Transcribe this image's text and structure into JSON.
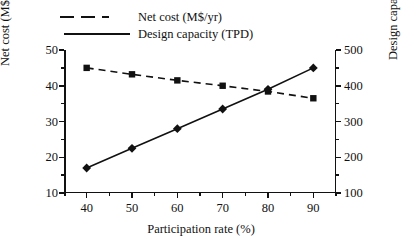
{
  "chart_data": {
    "type": "line",
    "title": "",
    "xlabel": "Participation rate (%)",
    "ylabel": "Net cost (M$/yr)",
    "ylabel_secondary": "Design capacity (TPD)",
    "x": [
      40,
      50,
      60,
      70,
      80,
      90
    ],
    "xlim": [
      35,
      95
    ],
    "xticks": [
      40,
      50,
      60,
      70,
      80,
      90
    ],
    "xtick_labels": [
      "40",
      "50",
      "60",
      "70",
      "80",
      "90"
    ],
    "ylim": [
      10,
      50
    ],
    "yticks": [
      10,
      20,
      30,
      40,
      50
    ],
    "ytick_labels": [
      "10",
      "20",
      "30",
      "40",
      "50"
    ],
    "ylim_secondary": [
      100,
      500
    ],
    "yticks_secondary": [
      100,
      200,
      300,
      400,
      500
    ],
    "ytick_labels_secondary": [
      "100",
      "200",
      "300",
      "400",
      "500"
    ],
    "grid": false,
    "legend_position": "top",
    "series": [
      {
        "name": "Net cost (M$/yr)",
        "axis": "left",
        "style": "dashed",
        "marker": "square",
        "color": "#111111",
        "values": [
          45.0,
          43.2,
          41.5,
          40.0,
          38.4,
          36.5
        ]
      },
      {
        "name": "Design capacity (TPD)",
        "axis": "right",
        "style": "solid",
        "marker": "diamond",
        "color": "#111111",
        "values": [
          170,
          225,
          280,
          335,
          390,
          450
        ]
      }
    ]
  },
  "legend": {
    "items": [
      {
        "label": "Net cost (M$/yr)",
        "key": "dashed-line-key"
      },
      {
        "label": "Design capacity (TPD)",
        "key": "solid-line-key"
      }
    ]
  },
  "axes": {
    "x_title": "Participation rate (%)",
    "y_left_title": "Net cost (M$/yr)",
    "y_right_title": "Design capacity (TPD)"
  }
}
